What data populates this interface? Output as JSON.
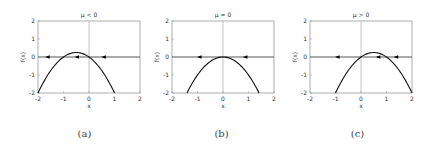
{
  "chart_data": [
    {
      "type": "line",
      "panel": "a",
      "title": "μ < 0",
      "xlabel": "x",
      "ylabel": "f(x)",
      "xlim": [
        -2,
        2
      ],
      "ylim": [
        -2,
        2
      ],
      "xticks": [
        "-2",
        "-1",
        "0",
        "1",
        "2"
      ],
      "yticks": [
        "-2",
        "-1",
        "0",
        "1",
        "2"
      ],
      "function": "f(x) = μx − x², μ = −1",
      "mu": -1,
      "x_range": [
        -2,
        1
      ],
      "fixed_points": [
        -1,
        0
      ],
      "arrows": [
        {
          "x": -1.6,
          "dir": "left"
        },
        {
          "x": -0.45,
          "dir": "left"
        },
        {
          "x": 0.6,
          "dir": "left"
        }
      ],
      "caption": "(a)"
    },
    {
      "type": "line",
      "panel": "b",
      "title": "μ = 0",
      "xlabel": "x",
      "ylabel": "f(x)",
      "xlim": [
        -2,
        2
      ],
      "ylim": [
        -2,
        2
      ],
      "xticks": [
        "-2",
        "-1",
        "0",
        "1",
        "2"
      ],
      "yticks": [
        "-2",
        "-1",
        "0",
        "1",
        "2"
      ],
      "function": "f(x) = μx − x², μ = 0",
      "mu": 0,
      "x_range": [
        -1.414,
        1.414
      ],
      "fixed_points": [
        0
      ],
      "arrows": [
        {
          "x": -0.9,
          "dir": "left"
        },
        {
          "x": 0.9,
          "dir": "left"
        }
      ],
      "caption": "(b)"
    },
    {
      "type": "line",
      "panel": "c",
      "title": "μ > 0",
      "xlabel": "x",
      "ylabel": "f(x)",
      "xlim": [
        -2,
        2
      ],
      "ylim": [
        -2,
        2
      ],
      "xticks": [
        "-2",
        "-1",
        "0",
        "1",
        "2"
      ],
      "yticks": [
        "-2",
        "-1",
        "0",
        "1",
        "2"
      ],
      "function": "f(x) = μx − x², μ = 1",
      "mu": 1,
      "x_range": [
        -1,
        2
      ],
      "fixed_points": [
        0,
        1
      ],
      "arrows": [
        {
          "x": -0.9,
          "dir": "left"
        },
        {
          "x": 0.7,
          "dir": "left"
        },
        {
          "x": 1.4,
          "dir": "left"
        }
      ],
      "caption": "(c)"
    }
  ],
  "panels": [
    {
      "title": "μ < 0",
      "caption": "(a)"
    },
    {
      "title": "μ = 0",
      "caption": "(b)"
    },
    {
      "title": "μ > 0",
      "caption": "(c)"
    }
  ],
  "axis": {
    "xlabel": "x",
    "ylabel": "f(x)",
    "ticks": [
      "-2",
      "-1",
      "0",
      "1",
      "2"
    ]
  }
}
